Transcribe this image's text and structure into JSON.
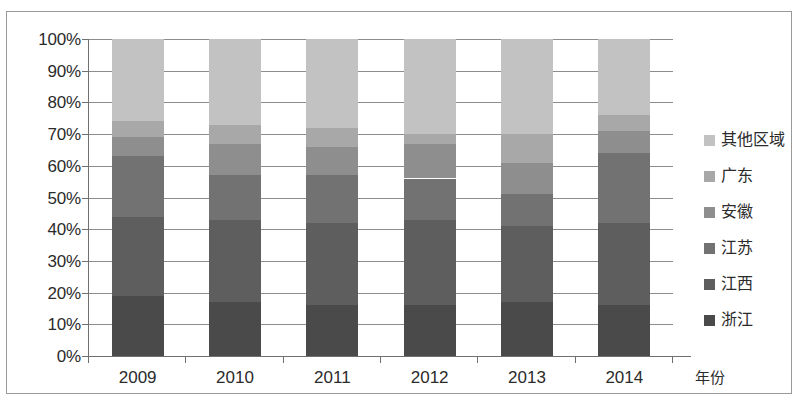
{
  "chart_data": {
    "type": "bar",
    "stacked": true,
    "normalized": true,
    "title": "",
    "xlabel": "年份",
    "ylabel": "",
    "categories": [
      "2009",
      "2010",
      "2011",
      "2012",
      "2013",
      "2014"
    ],
    "ylim": [
      0,
      100
    ],
    "ytick_labels": [
      "0%",
      "10%",
      "20%",
      "30%",
      "40%",
      "50%",
      "60%",
      "70%",
      "80%",
      "90%",
      "100%"
    ],
    "ytick_values": [
      0,
      10,
      20,
      30,
      40,
      50,
      60,
      70,
      80,
      90,
      100
    ],
    "grid": true,
    "legend_position": "right",
    "series": [
      {
        "name": "浙江",
        "color": "#4a4a4a",
        "values": [
          19,
          17,
          16,
          16,
          17,
          16
        ]
      },
      {
        "name": "江西",
        "color": "#5e5e5e",
        "values": [
          25,
          26,
          26,
          27,
          24,
          26
        ]
      },
      {
        "name": "江苏",
        "color": "#727272",
        "values": [
          19,
          14,
          15,
          13,
          10,
          22
        ]
      },
      {
        "name": "安徽",
        "color": "#8e8e8e",
        "values": [
          6,
          10,
          9,
          11,
          10,
          7
        ]
      },
      {
        "name": "广东",
        "color": "#a8a8a8",
        "values": [
          5,
          6,
          6,
          3,
          9,
          5
        ]
      },
      {
        "name": "其他区域",
        "color": "#c2c2c2",
        "values": [
          26,
          27,
          28,
          30,
          30,
          24
        ]
      }
    ]
  },
  "legend": {
    "items": [
      {
        "label": "其他区域",
        "color": "#c2c2c2"
      },
      {
        "label": "广东",
        "color": "#a8a8a8"
      },
      {
        "label": "安徽",
        "color": "#8e8e8e"
      },
      {
        "label": "江苏",
        "color": "#727272"
      },
      {
        "label": "江西",
        "color": "#5e5e5e"
      },
      {
        "label": "浙江",
        "color": "#4a4a4a"
      }
    ]
  }
}
